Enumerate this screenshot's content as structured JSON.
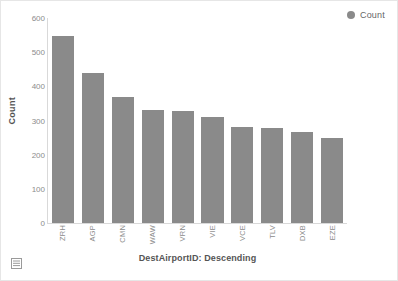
{
  "visual": {
    "background_color": "#ffffff",
    "border_color": "#e6e6e6"
  },
  "legend": {
    "position": "top-right",
    "swatch_icon": "legend-dot-icon",
    "items": [
      {
        "label": "Count",
        "color": "#8a8a8a"
      }
    ]
  },
  "footer": {
    "table_view_icon": "table-grid-icon"
  },
  "chart_data": {
    "type": "bar",
    "title": "",
    "xlabel": "DestAirportID: Descending",
    "ylabel": "Count",
    "ylim": [
      0,
      600
    ],
    "yticks": [
      0,
      100,
      200,
      300,
      400,
      500,
      600
    ],
    "ytick_labels": [
      "0",
      "100",
      "200",
      "300",
      "400",
      "500",
      "600"
    ],
    "grid": false,
    "legend_position": "top-right",
    "bar_color": "#8a8a8a",
    "categories": [
      "ZRH",
      "AGP",
      "CMN",
      "WAW",
      "VRN",
      "VIE",
      "VCE",
      "TLV",
      "DXB",
      "EZE"
    ],
    "values": [
      548,
      440,
      368,
      332,
      328,
      310,
      282,
      278,
      267,
      248
    ],
    "series": [
      {
        "name": "Count",
        "color": "#8a8a8a",
        "values": [
          548,
          440,
          368,
          332,
          328,
          310,
          282,
          278,
          267,
          248
        ]
      }
    ]
  }
}
